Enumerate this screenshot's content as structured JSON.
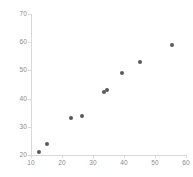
{
  "chart_data": {
    "type": "scatter",
    "title": "",
    "subtitle": "",
    "xlabel": "",
    "ylabel": "",
    "xlim": [
      10,
      60
    ],
    "ylim": [
      20,
      70
    ],
    "xticks": [
      10,
      20,
      30,
      40,
      50,
      60
    ],
    "yticks": [
      20,
      30,
      40,
      50,
      60,
      70
    ],
    "grid": false,
    "legend": false,
    "legend_position": "none",
    "marker": {
      "shape": "circle",
      "color": "#595959",
      "size_px": 4
    },
    "axis_color": "#d9d9d9",
    "tick_label_color": "#8c8c8c",
    "background": "#ffffff",
    "series": [
      {
        "name": "series-1",
        "points": [
          {
            "x": 12.5,
            "y": 21
          },
          {
            "x": 15,
            "y": 24
          },
          {
            "x": 23,
            "y": 33
          },
          {
            "x": 26.5,
            "y": 34
          },
          {
            "x": 33.5,
            "y": 42.5
          },
          {
            "x": 34.5,
            "y": 43
          },
          {
            "x": 39.5,
            "y": 49
          },
          {
            "x": 45,
            "y": 53
          },
          {
            "x": 55.5,
            "y": 59
          }
        ]
      }
    ]
  }
}
